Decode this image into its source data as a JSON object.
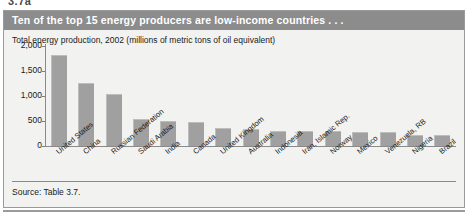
{
  "figure": {
    "number_partial": "3.7a",
    "title": "Ten of the top 15 energy producers are low-income countries . . .",
    "subtitle": "Total energy production, 2002 (millions of metric tons of oil equivalent)",
    "source": "Source: Table 3.7.",
    "colors": {
      "title_band": "#8c8c8c",
      "panel_background": "#f2f2f0",
      "bar_fill": "#a0a0a0",
      "axis": "#8a8a8a",
      "border": "#9a9a9a"
    }
  },
  "chart_data": {
    "type": "bar",
    "title": "Ten of the top 15 energy producers are low-income countries . . .",
    "subtitle": "Total energy production, 2002 (millions of metric tons of oil equivalent)",
    "xlabel": "",
    "ylabel": "",
    "ylim": [
      0,
      2000
    ],
    "yticks": [
      0,
      500,
      1000,
      1500,
      2000
    ],
    "ytick_labels": [
      "0",
      "500",
      "1,000",
      "1,500",
      "2,000"
    ],
    "grid": false,
    "legend": false,
    "categories": [
      "United States",
      "China",
      "Russian Federation",
      "Saudi Arabia",
      "India",
      "Canada",
      "United Kingdom",
      "Australia",
      "Indonesia",
      "Iran, Islamic Rep.",
      "Norway",
      "Mexico",
      "Venezuela, RB",
      "Nigeria",
      "Brazil"
    ],
    "values": [
      1820,
      1260,
      1040,
      540,
      500,
      480,
      360,
      340,
      300,
      300,
      300,
      290,
      280,
      230,
      220
    ]
  }
}
